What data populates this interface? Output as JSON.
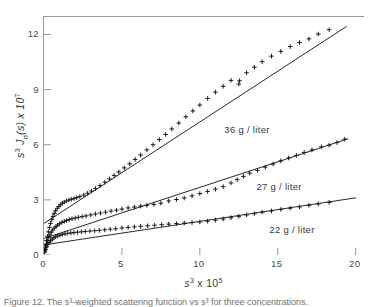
{
  "figure": {
    "caption": "Figure 12.  The s³-weighted scattering function vs s³ for three concentrations."
  },
  "axes": {
    "x_title_main": "s",
    "x_title_exp": "3",
    "x_title_mult": " x 10",
    "x_title_mult_exp": "5",
    "y_title_s": "s",
    "y_title_s_exp": "3",
    "y_title_fn": " J",
    "y_title_sub": "n",
    "y_title_arg": "(s) x 10",
    "y_title_exp": "7",
    "x_ticks": [
      "0",
      "5",
      "10",
      "15",
      "20"
    ],
    "y_ticks": [
      "0",
      "3",
      "6",
      "9",
      "12"
    ],
    "xlim": [
      0,
      20.6
    ],
    "ylim": [
      0,
      12.95
    ],
    "grid": false
  },
  "annotations": [
    {
      "name": "label-36",
      "text": "36 g / liter",
      "x": 0.565,
      "y": 0.545
    },
    {
      "name": "label-27",
      "text": "27 g / liter",
      "x": 0.665,
      "y": 0.305
    },
    {
      "name": "label-22",
      "text": "22 g / liter",
      "x": 0.705,
      "y": 0.128
    }
  ],
  "chart_data": {
    "type": "scatter",
    "title": "",
    "xlabel": "s^3 x 10^5",
    "ylabel": "s^3 J_n(s) x 10^7",
    "xlim": [
      0,
      20.6
    ],
    "ylim": [
      0,
      12.95
    ],
    "grid": false,
    "marker": "+",
    "marker_color": "#111111",
    "fit_line_color": "#111111",
    "legend": "inline-annotations",
    "series": [
      {
        "name": "36 g / liter",
        "color": "#111111",
        "fit_line": {
          "intercept": 1.72,
          "slope": 0.552,
          "x_start": 0.0,
          "x_end": 19.4
        },
        "points": [
          [
            0.05,
            0.28
          ],
          [
            0.1,
            0.52
          ],
          [
            0.16,
            0.78
          ],
          [
            0.22,
            1.02
          ],
          [
            0.28,
            1.26
          ],
          [
            0.35,
            1.5
          ],
          [
            0.42,
            1.72
          ],
          [
            0.5,
            1.92
          ],
          [
            0.58,
            2.1
          ],
          [
            0.66,
            2.26
          ],
          [
            0.75,
            2.41
          ],
          [
            0.85,
            2.54
          ],
          [
            0.95,
            2.64
          ],
          [
            1.05,
            2.73
          ],
          [
            1.18,
            2.82
          ],
          [
            1.3,
            2.88
          ],
          [
            1.45,
            2.94
          ],
          [
            1.6,
            2.99
          ],
          [
            1.75,
            3.03
          ],
          [
            1.92,
            3.07
          ],
          [
            2.1,
            3.12
          ],
          [
            2.3,
            3.18
          ],
          [
            2.55,
            3.26
          ],
          [
            2.8,
            3.36
          ],
          [
            3.05,
            3.48
          ],
          [
            3.3,
            3.62
          ],
          [
            3.6,
            3.78
          ],
          [
            3.9,
            3.96
          ],
          [
            4.2,
            4.14
          ],
          [
            4.5,
            4.33
          ],
          [
            4.8,
            4.52
          ],
          [
            5.15,
            4.74
          ],
          [
            5.5,
            4.96
          ],
          [
            5.85,
            5.2
          ],
          [
            6.2,
            5.44
          ],
          [
            6.6,
            5.72
          ],
          [
            7.0,
            6.0
          ],
          [
            7.4,
            6.28
          ],
          [
            7.8,
            6.56
          ],
          [
            8.2,
            6.86
          ],
          [
            8.65,
            7.18
          ],
          [
            9.1,
            7.52
          ],
          [
            9.55,
            7.84
          ],
          [
            10.0,
            8.16
          ],
          [
            10.5,
            8.52
          ],
          [
            11.0,
            8.86
          ],
          [
            11.5,
            9.18
          ],
          [
            12.0,
            9.5
          ],
          [
            12.5,
            9.3
          ],
          [
            12.55,
            9.48
          ],
          [
            13.0,
            9.92
          ],
          [
            13.5,
            10.22
          ],
          [
            14.0,
            10.52
          ],
          [
            14.6,
            10.82
          ],
          [
            15.2,
            11.08
          ],
          [
            15.8,
            11.34
          ],
          [
            16.4,
            11.56
          ],
          [
            17.0,
            11.76
          ],
          [
            17.6,
            12.02
          ],
          [
            18.3,
            12.26
          ]
        ]
      },
      {
        "name": "27 g / liter",
        "color": "#111111",
        "fit_line": {
          "intercept": 0.9,
          "slope": 0.278,
          "x_start": 0.0,
          "x_end": 19.5
        },
        "points": [
          [
            0.05,
            0.22
          ],
          [
            0.1,
            0.42
          ],
          [
            0.16,
            0.6
          ],
          [
            0.22,
            0.78
          ],
          [
            0.3,
            0.95
          ],
          [
            0.38,
            1.1
          ],
          [
            0.47,
            1.24
          ],
          [
            0.56,
            1.36
          ],
          [
            0.66,
            1.46
          ],
          [
            0.77,
            1.55
          ],
          [
            0.88,
            1.63
          ],
          [
            1.0,
            1.7
          ],
          [
            1.15,
            1.77
          ],
          [
            1.3,
            1.83
          ],
          [
            1.45,
            1.88
          ],
          [
            1.62,
            1.93
          ],
          [
            1.8,
            1.97
          ],
          [
            2.0,
            2.01
          ],
          [
            2.2,
            2.05
          ],
          [
            2.45,
            2.09
          ],
          [
            2.7,
            2.13
          ],
          [
            3.0,
            2.18
          ],
          [
            3.3,
            2.23
          ],
          [
            3.62,
            2.28
          ],
          [
            3.95,
            2.33
          ],
          [
            4.3,
            2.39
          ],
          [
            4.65,
            2.44
          ],
          [
            5.0,
            2.5
          ],
          [
            5.4,
            2.56
          ],
          [
            5.8,
            2.61
          ],
          [
            6.2,
            2.66
          ],
          [
            6.6,
            2.7
          ],
          [
            7.05,
            2.75
          ],
          [
            7.5,
            2.82
          ],
          [
            8.0,
            2.94
          ],
          [
            8.5,
            3.02
          ],
          [
            9.0,
            3.1
          ],
          [
            9.5,
            3.22
          ],
          [
            10.0,
            3.34
          ],
          [
            10.5,
            3.46
          ],
          [
            11.0,
            3.58
          ],
          [
            11.5,
            3.72
          ],
          [
            12.0,
            3.92
          ],
          [
            12.4,
            4.1
          ],
          [
            12.8,
            4.28
          ],
          [
            13.2,
            4.45
          ],
          [
            13.7,
            4.6
          ],
          [
            14.2,
            4.78
          ],
          [
            14.7,
            4.95
          ],
          [
            15.2,
            5.12
          ],
          [
            15.7,
            5.28
          ],
          [
            16.2,
            5.42
          ],
          [
            16.7,
            5.58
          ],
          [
            17.2,
            5.72
          ],
          [
            17.8,
            5.88
          ],
          [
            18.3,
            5.98
          ],
          [
            18.8,
            6.12
          ],
          [
            19.3,
            6.3
          ]
        ]
      },
      {
        "name": "22 g / liter",
        "color": "#111111",
        "fit_line": {
          "intercept": 0.55,
          "slope": 0.128,
          "x_start": 0.0,
          "x_end": 20.0
        },
        "points": [
          [
            0.05,
            0.16
          ],
          [
            0.1,
            0.3
          ],
          [
            0.17,
            0.44
          ],
          [
            0.25,
            0.57
          ],
          [
            0.33,
            0.68
          ],
          [
            0.42,
            0.78
          ],
          [
            0.52,
            0.86
          ],
          [
            0.63,
            0.93
          ],
          [
            0.75,
            0.99
          ],
          [
            0.88,
            1.04
          ],
          [
            1.02,
            1.08
          ],
          [
            1.18,
            1.12
          ],
          [
            1.35,
            1.15
          ],
          [
            1.52,
            1.18
          ],
          [
            1.72,
            1.2
          ],
          [
            1.92,
            1.22
          ],
          [
            2.15,
            1.24
          ],
          [
            2.4,
            1.26
          ],
          [
            2.65,
            1.28
          ],
          [
            2.95,
            1.3
          ],
          [
            3.25,
            1.32
          ],
          [
            3.55,
            1.34
          ],
          [
            3.9,
            1.37
          ],
          [
            4.25,
            1.4
          ],
          [
            4.6,
            1.43
          ],
          [
            5.0,
            1.47
          ],
          [
            5.4,
            1.5
          ],
          [
            5.8,
            1.53
          ],
          [
            6.2,
            1.56
          ],
          [
            6.65,
            1.59
          ],
          [
            7.1,
            1.62
          ],
          [
            7.55,
            1.65
          ],
          [
            8.0,
            1.68
          ],
          [
            8.5,
            1.71
          ],
          [
            9.0,
            1.74
          ],
          [
            9.5,
            1.77
          ],
          [
            10.0,
            1.8
          ],
          [
            10.5,
            1.84
          ],
          [
            11.0,
            1.9
          ],
          [
            11.5,
            1.96
          ],
          [
            12.0,
            2.03
          ],
          [
            12.5,
            2.1
          ],
          [
            13.0,
            2.18
          ],
          [
            13.5,
            2.25
          ],
          [
            14.0,
            2.33
          ],
          [
            14.6,
            2.4
          ],
          [
            15.2,
            2.48
          ],
          [
            15.8,
            2.55
          ],
          [
            16.4,
            2.62
          ],
          [
            17.0,
            2.7
          ],
          [
            17.6,
            2.78
          ],
          [
            18.3,
            2.86
          ]
        ]
      }
    ]
  }
}
